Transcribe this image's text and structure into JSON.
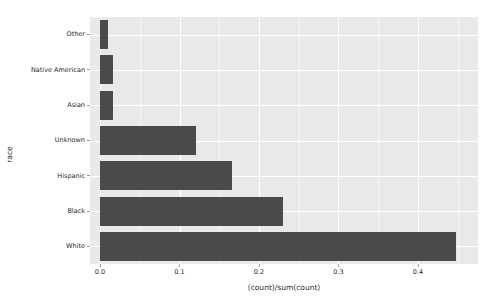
{
  "chart_data": {
    "type": "bar",
    "orientation": "horizontal",
    "title": "",
    "subtitle": "",
    "xlabel": "(count)/sum(count)",
    "ylabel": "race",
    "categories": [
      "White",
      "Black",
      "Hispanic",
      "Unknown",
      "Asian",
      "Native American",
      "Other"
    ],
    "values": [
      0.448,
      0.23,
      0.166,
      0.121,
      0.016,
      0.016,
      0.01
    ],
    "series": [
      {
        "name": "(count)/sum(count)",
        "values": [
          0.448,
          0.23,
          0.166,
          0.121,
          0.016,
          0.016,
          0.01
        ]
      }
    ],
    "xlim": [
      -0.0126,
      0.4755
    ],
    "xticks": [
      0.0,
      0.1,
      0.2,
      0.3,
      0.4
    ],
    "xtick_labels": [
      "0.0",
      "0.1",
      "0.2",
      "0.3",
      "0.4"
    ],
    "xticks_minor": [
      0.05,
      0.15,
      0.25,
      0.35,
      0.45
    ],
    "grid": true,
    "legend": "none",
    "bar_color": "#4a4a4a",
    "panel_background": "#e9e9e9",
    "gridline_color": "#ffffff",
    "plot_background": "#ffffff"
  }
}
